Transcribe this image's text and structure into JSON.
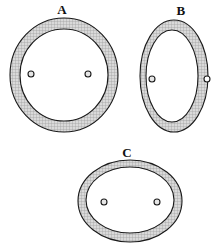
{
  "figure": {
    "title": "",
    "background_color": "#ffffff",
    "stroke_color": "#1a1a1a",
    "ring_fill_color": "#cccccc",
    "inner_fill_color": "#ffffff",
    "marker_fill_color": "#e6e6e6",
    "panels": [
      {
        "id": "A",
        "label": "A",
        "shape": "annulus",
        "description": "near-circular ring with two small circular markers inside the inner region",
        "outer": {
          "cx": 64,
          "cy": 75,
          "rx": 54,
          "ry": 57
        },
        "inner": {
          "cx": 64,
          "cy": 75,
          "rx": 44,
          "ry": 46
        },
        "markers": [
          {
            "cx": 31,
            "cy": 74,
            "r": 3
          },
          {
            "cx": 88,
            "cy": 74,
            "r": 3
          }
        ]
      },
      {
        "id": "B",
        "label": "B",
        "shape": "annulus",
        "description": "vertically elongated ring; left marker inside inner region, right marker on outer boundary",
        "outer": {
          "cx": 174,
          "cy": 76,
          "rx": 34,
          "ry": 56
        },
        "inner": {
          "cx": 172,
          "cy": 76,
          "rx": 26,
          "ry": 46
        },
        "markers": [
          {
            "cx": 152,
            "cy": 79,
            "r": 3
          },
          {
            "cx": 207,
            "cy": 79,
            "r": 3
          }
        ]
      },
      {
        "id": "C",
        "label": "C",
        "shape": "annulus",
        "description": "horizontally elongated ring with two small circular markers inside the inner region",
        "outer": {
          "cx": 130,
          "cy": 201,
          "rx": 52,
          "ry": 41
        },
        "inner": {
          "cx": 130,
          "cy": 200,
          "rx": 44,
          "ry": 33
        },
        "markers": [
          {
            "cx": 104,
            "cy": 202,
            "r": 3
          },
          {
            "cx": 157,
            "cy": 202,
            "r": 3
          }
        ]
      }
    ]
  }
}
